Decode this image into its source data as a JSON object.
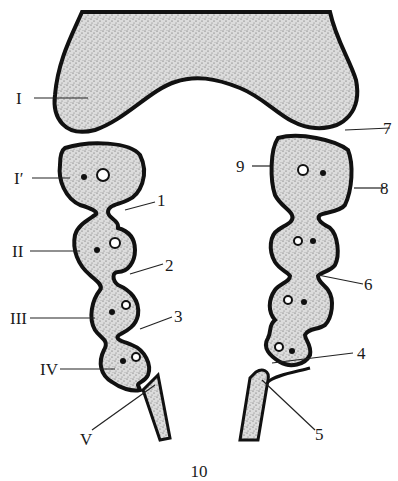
{
  "figure": {
    "number": "10",
    "colors": {
      "outline": "#111111",
      "stipple_fill": "#d9d9d9",
      "dots": "#555555",
      "background": "#ffffff"
    }
  },
  "labels": {
    "left": [
      {
        "id": "I",
        "text": "I"
      },
      {
        "id": "I_prime",
        "text": "I′"
      },
      {
        "id": "II",
        "text": "II"
      },
      {
        "id": "III",
        "text": "III"
      },
      {
        "id": "IV",
        "text": "IV"
      },
      {
        "id": "V",
        "text": "V"
      }
    ],
    "right": [
      {
        "id": "1",
        "text": "1"
      },
      {
        "id": "2",
        "text": "2"
      },
      {
        "id": "3",
        "text": "3"
      },
      {
        "id": "4",
        "text": "4"
      },
      {
        "id": "5",
        "text": "5"
      },
      {
        "id": "6",
        "text": "6"
      },
      {
        "id": "7",
        "text": "7"
      },
      {
        "id": "8",
        "text": "8"
      },
      {
        "id": "9",
        "text": "9"
      }
    ]
  }
}
